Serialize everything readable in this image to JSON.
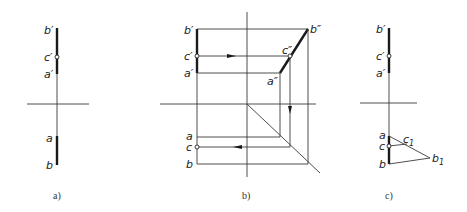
{
  "figure": {
    "subfigures": [
      {
        "id": "a",
        "caption": "a)",
        "labels": {
          "b_prime": "b′",
          "c_prime": "c′",
          "a_prime": "a′",
          "a": "a",
          "b": "b"
        }
      },
      {
        "id": "b",
        "caption": "b)",
        "labels": {
          "b_prime": "b′",
          "c_prime": "c′",
          "a_prime": "a′",
          "b_dprime": "b″",
          "c_dprime": "c″",
          "a_dprime": "a″",
          "a": "a",
          "c": "c",
          "b": "b"
        }
      },
      {
        "id": "c",
        "caption": "c)",
        "labels": {
          "b_prime": "b′",
          "c_prime": "c′",
          "a_prime": "a′",
          "a": "a",
          "c": "c",
          "b": "b",
          "c1": "c",
          "c1_sub": "1",
          "b1": "b",
          "b1_sub": "1"
        }
      }
    ]
  },
  "colors": {
    "line": "#1a1a1a",
    "background": "#ffffff"
  }
}
